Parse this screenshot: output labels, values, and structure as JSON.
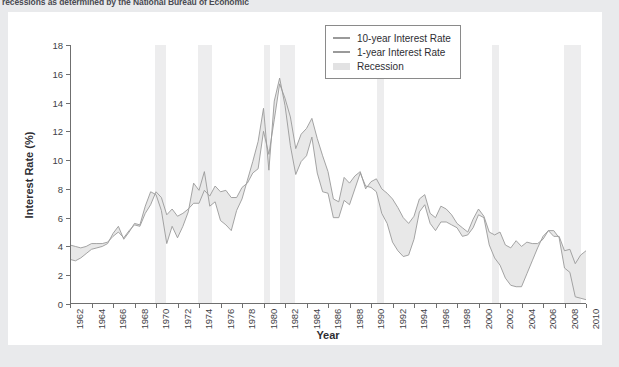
{
  "caption": {
    "clipped_line": "recessions as determined by the National Bureau of Economic"
  },
  "legend": {
    "items": [
      {
        "label": "10-year Interest Rate",
        "marker": "line",
        "color": "#9a9a9a"
      },
      {
        "label": "1-year Interest Rate",
        "marker": "line",
        "color": "#9a9a9a"
      },
      {
        "label": "Recession",
        "marker": "box",
        "color": "#e2e2e3"
      }
    ]
  },
  "chart_data": {
    "type": "line",
    "title": "",
    "xlabel": "Year",
    "ylabel": "Interest Rate (%)",
    "xlim": [
      1962,
      2010
    ],
    "ylim": [
      0,
      18
    ],
    "yticks": [
      0,
      2,
      4,
      6,
      8,
      10,
      12,
      14,
      16,
      18
    ],
    "xticks": [
      1962,
      1964,
      1966,
      1968,
      1970,
      1972,
      1974,
      1976,
      1978,
      1980,
      1982,
      1984,
      1986,
      1988,
      1990,
      1992,
      1994,
      1996,
      1998,
      2000,
      2002,
      2004,
      2006,
      2008,
      2010
    ],
    "grid": false,
    "legend_position": "upper right",
    "fill_between_series": true,
    "fill_color": "#e8e8e8",
    "line_color": "#9a9a9a",
    "recession_color": "#ededee",
    "recessions": [
      {
        "start": 1969.92,
        "end": 1970.92
      },
      {
        "start": 1973.92,
        "end": 1975.25
      },
      {
        "start": 1980.0,
        "end": 1980.58
      },
      {
        "start": 1981.58,
        "end": 1982.92
      },
      {
        "start": 1990.58,
        "end": 1991.25
      },
      {
        "start": 2001.25,
        "end": 2001.92
      },
      {
        "start": 2007.92,
        "end": 2009.5
      }
    ],
    "series": [
      {
        "name": "10-year Interest Rate",
        "x": [
          1962.0,
          1962.5,
          1963.0,
          1963.5,
          1964.0,
          1964.5,
          1965.0,
          1965.5,
          1966.0,
          1966.5,
          1967.0,
          1967.5,
          1968.0,
          1968.5,
          1969.0,
          1969.5,
          1970.0,
          1970.5,
          1971.0,
          1971.5,
          1972.0,
          1972.5,
          1973.0,
          1973.5,
          1974.0,
          1974.5,
          1975.0,
          1975.5,
          1976.0,
          1976.5,
          1977.0,
          1977.5,
          1978.0,
          1978.5,
          1979.0,
          1979.5,
          1980.0,
          1980.5,
          1981.0,
          1981.5,
          1982.0,
          1982.5,
          1983.0,
          1983.5,
          1984.0,
          1984.5,
          1985.0,
          1985.5,
          1986.0,
          1986.5,
          1987.0,
          1987.5,
          1988.0,
          1988.5,
          1989.0,
          1989.5,
          1990.0,
          1990.5,
          1991.0,
          1991.5,
          1992.0,
          1992.5,
          1993.0,
          1993.5,
          1994.0,
          1994.5,
          1995.0,
          1995.5,
          1996.0,
          1996.5,
          1997.0,
          1997.5,
          1998.0,
          1998.5,
          1999.0,
          1999.5,
          2000.0,
          2000.5,
          2001.0,
          2001.5,
          2002.0,
          2002.5,
          2003.0,
          2003.5,
          2004.0,
          2004.5,
          2005.0,
          2005.5,
          2006.0,
          2006.5,
          2007.0,
          2007.5,
          2008.0,
          2008.5,
          2009.0,
          2009.5,
          2010.0
        ],
        "y": [
          4.1,
          4.0,
          3.9,
          4.0,
          4.2,
          4.2,
          4.2,
          4.3,
          4.7,
          5.0,
          4.6,
          5.1,
          5.5,
          5.4,
          6.3,
          6.9,
          7.8,
          7.4,
          6.2,
          6.6,
          6.1,
          6.3,
          6.6,
          7.0,
          7.0,
          7.9,
          7.5,
          8.2,
          7.8,
          7.9,
          7.4,
          7.4,
          8.1,
          8.4,
          9.1,
          9.4,
          12.0,
          10.4,
          12.8,
          15.3,
          14.3,
          13.0,
          10.8,
          11.8,
          12.2,
          12.9,
          11.5,
          10.3,
          9.2,
          7.3,
          7.1,
          8.8,
          8.4,
          8.9,
          9.2,
          8.0,
          8.5,
          8.7,
          8.0,
          7.7,
          7.3,
          6.7,
          6.0,
          5.6,
          6.1,
          7.3,
          7.6,
          6.3,
          6.0,
          6.8,
          6.6,
          6.2,
          5.6,
          5.3,
          5.0,
          5.9,
          6.6,
          6.1,
          5.0,
          4.8,
          5.0,
          4.1,
          3.9,
          4.4,
          4.0,
          4.3,
          4.2,
          4.2,
          4.5,
          5.1,
          4.7,
          4.7,
          3.7,
          3.8,
          2.8,
          3.4,
          3.7
        ]
      },
      {
        "name": "1-year Interest Rate",
        "x": [
          1962.0,
          1962.5,
          1963.0,
          1963.5,
          1964.0,
          1964.5,
          1965.0,
          1965.5,
          1966.0,
          1966.5,
          1967.0,
          1967.5,
          1968.0,
          1968.5,
          1969.0,
          1969.5,
          1970.0,
          1970.5,
          1971.0,
          1971.5,
          1972.0,
          1972.5,
          1973.0,
          1973.5,
          1974.0,
          1974.5,
          1975.0,
          1975.5,
          1976.0,
          1976.5,
          1977.0,
          1977.5,
          1978.0,
          1978.5,
          1979.0,
          1979.5,
          1980.0,
          1980.5,
          1981.0,
          1981.5,
          1982.0,
          1982.5,
          1983.0,
          1983.5,
          1984.0,
          1984.5,
          1985.0,
          1985.5,
          1986.0,
          1986.5,
          1987.0,
          1987.5,
          1988.0,
          1988.5,
          1989.0,
          1989.5,
          1990.0,
          1990.5,
          1991.0,
          1991.5,
          1992.0,
          1992.5,
          1993.0,
          1993.5,
          1994.0,
          1994.5,
          1995.0,
          1995.5,
          1996.0,
          1996.5,
          1997.0,
          1997.5,
          1998.0,
          1998.5,
          1999.0,
          1999.5,
          2000.0,
          2000.5,
          2001.0,
          2001.5,
          2002.0,
          2002.5,
          2003.0,
          2003.5,
          2004.0,
          2004.5,
          2005.0,
          2005.5,
          2006.0,
          2006.5,
          2007.0,
          2007.5,
          2008.0,
          2008.5,
          2009.0,
          2009.5,
          2010.0
        ],
        "y": [
          3.1,
          3.0,
          3.2,
          3.5,
          3.8,
          3.9,
          4.0,
          4.2,
          4.9,
          5.4,
          4.5,
          5.0,
          5.6,
          5.5,
          6.8,
          7.8,
          7.6,
          6.5,
          4.2,
          5.4,
          4.6,
          5.4,
          6.4,
          8.4,
          7.9,
          9.2,
          6.8,
          7.1,
          5.8,
          5.5,
          5.1,
          6.5,
          7.3,
          8.6,
          9.9,
          11.3,
          13.6,
          9.3,
          14.1,
          15.7,
          13.8,
          11.0,
          9.0,
          9.9,
          10.3,
          11.6,
          9.1,
          7.8,
          7.7,
          6.0,
          6.0,
          7.2,
          6.9,
          8.0,
          9.1,
          8.2,
          8.1,
          7.8,
          6.3,
          5.6,
          4.3,
          3.7,
          3.3,
          3.4,
          4.5,
          6.4,
          6.9,
          5.6,
          5.1,
          5.7,
          5.7,
          5.5,
          5.3,
          4.7,
          4.8,
          5.3,
          6.2,
          6.0,
          4.1,
          3.2,
          2.7,
          1.8,
          1.3,
          1.2,
          1.2,
          2.1,
          3.0,
          3.9,
          4.7,
          5.1,
          5.1,
          4.6,
          2.5,
          2.2,
          0.5,
          0.4,
          0.3
        ]
      }
    ]
  }
}
